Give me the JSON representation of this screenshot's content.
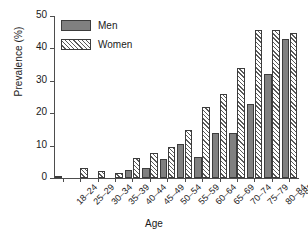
{
  "chart_data": {
    "type": "bar",
    "title": "",
    "subtitle": "",
    "xlabel": "Age",
    "ylabel": "Prevalence (%)",
    "ylim": [
      0,
      50
    ],
    "yticks": [
      0,
      10,
      20,
      30,
      40,
      50
    ],
    "grid": false,
    "legend_position": "top-left",
    "categories": [
      "18–24",
      "25–29",
      "30–34",
      "35–39",
      "40–44",
      "45–49",
      "50–54",
      "55–59",
      "60–64",
      "65–69",
      "70–74",
      "75–79",
      "80–84",
      ">85"
    ],
    "series": [
      {
        "name": "Men",
        "color": "#808080",
        "pattern": "solid",
        "values": [
          0.7,
          0.0,
          0.0,
          0.0,
          2.4,
          3.2,
          5.8,
          10.4,
          6.4,
          13.9,
          13.9,
          22.7,
          32.0,
          42.8
        ]
      },
      {
        "name": "Women",
        "color": "#ffffff",
        "pattern": "diagonal-hatch",
        "values": [
          0.0,
          3.2,
          2.2,
          1.5,
          6.1,
          7.8,
          9.5,
          14.7,
          21.8,
          26.0,
          34.0,
          45.6,
          45.7,
          44.8
        ]
      }
    ]
  },
  "legend": {
    "items": [
      {
        "label": "Men"
      },
      {
        "label": "Women"
      }
    ]
  },
  "axis": {
    "y_label": "Prevalence (%)",
    "x_label": "Age",
    "y_tick_labels": [
      "0",
      "10",
      "20",
      "30",
      "40",
      "50"
    ]
  }
}
